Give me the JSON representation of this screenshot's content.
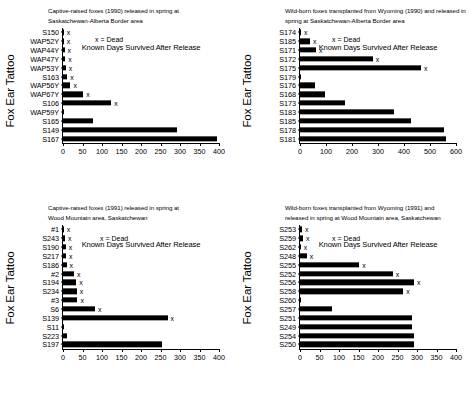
{
  "figure": {
    "axis_titles": {
      "y": "Fox Ear Tattoo",
      "x": "Known Days Survived After Release"
    },
    "legend_text": "x = Dead"
  },
  "chart_data": [
    {
      "id": "captive-1990",
      "type": "bar",
      "orientation": "horizontal",
      "title_lines": [
        "Captive-raised foxes (1990) released in spring at",
        "Saskatchewan-Alberta Border area"
      ],
      "xlabel": "Known Days Survived After Release",
      "ylabel": "Fox Ear Tattoo",
      "xlim": [
        0,
        400
      ],
      "xticks": [
        0,
        50,
        100,
        150,
        200,
        250,
        300,
        350,
        400
      ],
      "grid": false,
      "legend": "x = Dead",
      "categories": [
        "S150",
        "WAP52Y",
        "WAP44Y",
        "WAP47Y",
        "WAP53Y",
        "S163",
        "WAP56Y",
        "WAP67Y",
        "S106",
        "WAP59Y",
        "S165",
        "S149",
        "S167"
      ],
      "values": [
        1,
        2,
        4,
        6,
        7,
        11,
        19,
        52,
        124,
        2,
        78,
        292,
        396
      ],
      "dead": [
        true,
        true,
        true,
        true,
        true,
        true,
        true,
        true,
        true,
        false,
        false,
        false,
        false
      ]
    },
    {
      "id": "wild-1990",
      "type": "bar",
      "orientation": "horizontal",
      "title_lines": [
        "Wild-born foxes transplanted from Wyoming (1990) and released in",
        "spring at Saskatchewan-Alberta Border area"
      ],
      "xlabel": "Known Days Survived After Release",
      "ylabel": "Fox Ear Tattoo",
      "xlim": [
        0,
        600
      ],
      "xticks": [
        0,
        100,
        200,
        300,
        400,
        500,
        600
      ],
      "grid": false,
      "legend": "x = Dead",
      "categories": [
        "S174",
        "S185",
        "S171",
        "S172",
        "S175",
        "S179",
        "S176",
        "S168",
        "S173",
        "S183",
        "S185",
        "S178",
        "S181"
      ],
      "values": [
        4,
        38,
        62,
        280,
        465,
        2,
        58,
        98,
        172,
        362,
        428,
        552,
        562
      ],
      "dead": [
        true,
        true,
        true,
        true,
        true,
        false,
        false,
        false,
        false,
        false,
        false,
        false,
        false
      ]
    },
    {
      "id": "captive-1991",
      "type": "bar",
      "orientation": "horizontal",
      "title_lines": [
        "Captive-raised foxes (1991) released in spring at",
        "Wood Mountain area, Saskatchewan"
      ],
      "xlabel": "Known Days Survived After Release",
      "ylabel": "Fox Ear Tattoo",
      "xlim": [
        0,
        400
      ],
      "xticks": [
        0,
        50,
        100,
        150,
        200,
        250,
        300,
        350,
        400
      ],
      "grid": false,
      "legend": "x = Dead",
      "categories": [
        "#1",
        "S243",
        "S190",
        "S217",
        "S186",
        "#2",
        "S194",
        "S234",
        "#3",
        "S6",
        "S139",
        "S11",
        "S223",
        "S197"
      ],
      "values": [
        1,
        5,
        7,
        8,
        9,
        28,
        34,
        35,
        37,
        82,
        268,
        2,
        10,
        254
      ],
      "dead": [
        true,
        true,
        true,
        true,
        true,
        true,
        true,
        true,
        true,
        true,
        true,
        false,
        false,
        false
      ]
    },
    {
      "id": "wild-1991",
      "type": "bar",
      "orientation": "horizontal",
      "title_lines": [
        "Wild-born foxes transplanted from Wyoming (1991) and",
        "released in spring at Wood Mountain area, Saskatchewan"
      ],
      "xlabel": "Known Days Survived After Release",
      "ylabel": "Fox Ear Tattoo",
      "xlim": [
        0,
        400
      ],
      "xticks": [
        0,
        50,
        100,
        150,
        200,
        250,
        300,
        350,
        400
      ],
      "grid": false,
      "legend": "x = Dead",
      "categories": [
        "S253",
        "S259",
        "S262",
        "S248",
        "S255",
        "S252",
        "S256",
        "S258",
        "S260",
        "S257",
        "S251",
        "S249",
        "S254",
        "S250"
      ],
      "values": [
        5,
        8,
        2,
        17,
        152,
        238,
        292,
        265,
        2,
        83,
        288,
        288,
        293,
        293
      ],
      "dead": [
        true,
        true,
        true,
        true,
        true,
        true,
        true,
        true,
        false,
        false,
        false,
        false,
        false,
        false
      ]
    }
  ]
}
